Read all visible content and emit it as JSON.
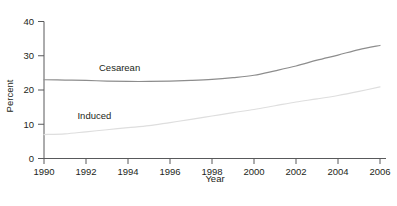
{
  "chart_data": {
    "type": "line",
    "title": "",
    "xlabel": "Year",
    "ylabel": "Percent",
    "xlim": [
      1990,
      2006
    ],
    "ylim": [
      0,
      40
    ],
    "grid": false,
    "legend_position": "inline-labels",
    "xticks": [
      "1990",
      "1992",
      "1994",
      "1996",
      "1998",
      "2000",
      "2002",
      "2004",
      "2006"
    ],
    "xtick_values": [
      1990,
      1992,
      1994,
      1996,
      1998,
      2000,
      2002,
      2004,
      2006
    ],
    "yticks": [
      "0",
      "10",
      "20",
      "30",
      "40"
    ],
    "ytick_values": [
      0,
      10,
      20,
      30,
      40
    ],
    "x": [
      1990,
      1991,
      1992,
      1993,
      1994,
      1995,
      1996,
      1997,
      1998,
      1999,
      2000,
      2001,
      2002,
      2003,
      2004,
      2005,
      2006
    ],
    "series": [
      {
        "name": "Cesarean",
        "color": "#8d8d8d",
        "label_x": 1993.6,
        "label_y": 25.6,
        "values": [
          23.0,
          22.9,
          22.8,
          22.6,
          22.5,
          22.5,
          22.6,
          22.8,
          23.1,
          23.6,
          24.3,
          25.6,
          27.0,
          28.7,
          30.2,
          31.8,
          33.0
        ]
      },
      {
        "name": "Induced",
        "color": "#dedede",
        "label_x": 1992.4,
        "label_y": 11.4,
        "values": [
          7.0,
          7.2,
          7.8,
          8.4,
          9.0,
          9.6,
          10.5,
          11.4,
          12.4,
          13.4,
          14.3,
          15.4,
          16.5,
          17.4,
          18.4,
          19.6,
          20.9
        ]
      }
    ]
  },
  "axes": {
    "x_title": "Year",
    "y_title": "Percent"
  }
}
